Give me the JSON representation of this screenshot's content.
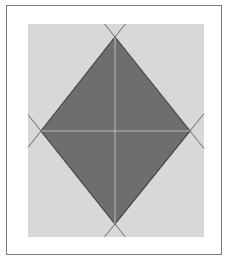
{
  "diagram": {
    "type": "rhombus-inscribed-in-rectangle",
    "colors": {
      "frame_border": "#7a7a7a",
      "background_rect": "#d8d8d8",
      "rhombus_fill": "#6e6e6e",
      "rhombus_outline": "#4a4a4a",
      "diagonals": "#b9b9b9",
      "extension_lines": "#6a6a6a"
    },
    "rectangle": {
      "x": 28,
      "y": 24,
      "width": 176,
      "height": 213
    },
    "rhombus": {
      "top": [
        115,
        37
      ],
      "right": [
        190,
        131
      ],
      "bottom": [
        115,
        224
      ],
      "left": [
        41,
        131
      ]
    },
    "center": [
      115,
      131
    ]
  }
}
